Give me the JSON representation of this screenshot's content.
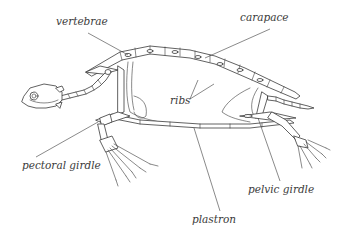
{
  "diagram": {
    "labels": {
      "vertebrae": "vertebrae",
      "carapace": "carapace",
      "ribs": "ribs",
      "pectoral_girdle": "pectoral girdle",
      "pelvic_girdle": "pelvic girdle",
      "plastron": "plastron"
    },
    "colors": {
      "line": "#3a3a3a",
      "background": "#ffffff"
    }
  }
}
